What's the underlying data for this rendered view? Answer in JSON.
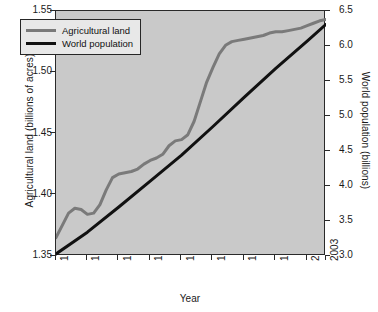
{
  "chart_data": {
    "type": "line",
    "title": "",
    "xlabel": "Year",
    "ylabel": "Agricultural land (billions of acres)",
    "ylabel_right": "World population (billions)",
    "xlim": [
      1960,
      2003
    ],
    "ylim": [
      1.35,
      1.55
    ],
    "ylim_right": [
      3.0,
      6.5
    ],
    "xticks": [
      1960,
      1965,
      1970,
      1975,
      1980,
      1985,
      1990,
      1995,
      2000,
      2003
    ],
    "xticklabels": [
      "1960",
      "1965",
      "1970",
      "1975",
      "1980",
      "1985",
      "1990",
      "1995",
      "2000",
      "2003"
    ],
    "yticks": [
      1.35,
      1.4,
      1.45,
      1.5,
      1.55
    ],
    "yticklabels": [
      "1.35",
      "1.40",
      "1.45",
      "1.50",
      "1.55"
    ],
    "yticks_right": [
      3.0,
      3.5,
      4.0,
      4.5,
      5.0,
      5.5,
      6.0,
      6.5
    ],
    "yticklabels_right": [
      "3.0",
      "3.5",
      "4.0",
      "4.5",
      "5.0",
      "5.5",
      "6.0",
      "6.5"
    ],
    "grid": false,
    "legend_position": "upper left",
    "background_color": "#c9c9c9",
    "series": [
      {
        "name": "Agricultural land",
        "axis": "left",
        "color": "#7a7a7a",
        "x": [
          1960,
          1961,
          1962,
          1963,
          1964,
          1965,
          1966,
          1967,
          1968,
          1969,
          1970,
          1971,
          1972,
          1973,
          1974,
          1975,
          1976,
          1977,
          1978,
          1979,
          1980,
          1981,
          1982,
          1983,
          1984,
          1985,
          1986,
          1987,
          1988,
          1989,
          1990,
          1991,
          1992,
          1993,
          1994,
          1995,
          1996,
          1997,
          1998,
          1999,
          2000,
          2001,
          2002,
          2003
        ],
        "values": [
          1.365,
          1.375,
          1.385,
          1.389,
          1.388,
          1.384,
          1.385,
          1.392,
          1.404,
          1.414,
          1.417,
          1.418,
          1.419,
          1.421,
          1.425,
          1.428,
          1.43,
          1.433,
          1.44,
          1.444,
          1.445,
          1.449,
          1.46,
          1.476,
          1.492,
          1.504,
          1.515,
          1.522,
          1.525,
          1.526,
          1.527,
          1.528,
          1.529,
          1.53,
          1.532,
          1.533,
          1.533,
          1.534,
          1.535,
          1.536,
          1.538,
          1.54,
          1.542,
          1.543
        ]
      },
      {
        "name": "World population",
        "axis": "right",
        "color": "#111111",
        "x": [
          1960,
          1965,
          1970,
          1975,
          1980,
          1985,
          1990,
          1995,
          2000,
          2003
        ],
        "values": [
          3.03,
          3.34,
          3.7,
          4.07,
          4.44,
          4.85,
          5.27,
          5.68,
          6.07,
          6.31
        ]
      }
    ]
  },
  "legend": {
    "items": [
      {
        "label": "Agricultural land",
        "color": "#7a7a7a"
      },
      {
        "label": "World population",
        "color": "#111111"
      }
    ]
  },
  "axes": {
    "x_title": "Year",
    "y_left_title": "Agricultural land (billions of acres)",
    "y_right_title": "World population (billions)"
  }
}
